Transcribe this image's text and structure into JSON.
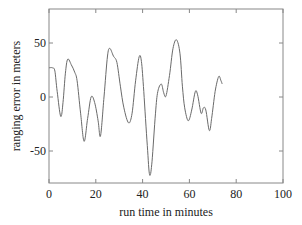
{
  "chart_data": {
    "type": "line",
    "title": "",
    "xlabel": "run time in minutes",
    "ylabel": "ranging error in meters",
    "xlim": [
      0,
      100
    ],
    "ylim": [
      -80,
      82
    ],
    "xticks": [
      0,
      20,
      40,
      60,
      80,
      100
    ],
    "yticks": [
      -50,
      0,
      50
    ],
    "grid": false,
    "legend": null,
    "series": [
      {
        "name": "ranging error",
        "x": [
          0,
          1.5,
          2.5,
          3.5,
          5,
          6,
          7,
          8,
          9.5,
          11,
          12,
          13.5,
          15,
          16.5,
          18,
          19.5,
          21,
          22,
          23.5,
          25,
          26,
          27.5,
          29,
          30.5,
          32,
          34,
          35.5,
          37,
          38.5,
          39.5,
          40.5,
          42,
          43,
          44,
          45.5,
          46.5,
          48,
          49,
          50,
          51.5,
          53,
          54.5,
          56,
          57,
          58,
          59.5,
          61,
          62.5,
          63.5,
          65,
          66,
          67,
          68.5,
          69.5,
          71,
          72.5,
          73.5,
          74
        ],
        "y": [
          27,
          27,
          24,
          5,
          -18,
          -5,
          22,
          35,
          30,
          23,
          15,
          -15,
          -41,
          -20,
          0,
          -5,
          -22,
          -36,
          0,
          38,
          45,
          38,
          32,
          10,
          -10,
          -24,
          -15,
          15,
          37,
          33,
          5,
          -45,
          -72,
          -60,
          -15,
          5,
          12,
          4,
          1,
          20,
          45,
          53,
          40,
          10,
          -10,
          -22,
          -12,
          5,
          2,
          -15,
          -10,
          -12,
          -31,
          -20,
          5,
          19,
          15,
          12
        ]
      }
    ]
  },
  "axes": {
    "x_tick_labels": [
      "0",
      "20",
      "40",
      "60",
      "80",
      "100"
    ],
    "y_tick_labels": [
      "50",
      "0",
      "-50"
    ],
    "xlabel": "run time in minutes",
    "ylabel": "ranging error in meters"
  },
  "colors": {
    "line": "#6a6a6a",
    "frame": "#888888",
    "text": "#222222"
  }
}
